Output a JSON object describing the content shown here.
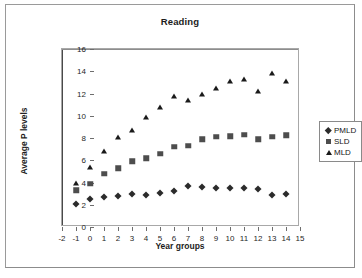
{
  "chart_data": {
    "type": "scatter",
    "title": "Reading",
    "xlabel": "Year groups",
    "ylabel": "Average P levels",
    "xlim": [
      -2,
      15
    ],
    "ylim": [
      0,
      16
    ],
    "xticks": [
      -2,
      -1,
      0,
      1,
      2,
      3,
      4,
      5,
      6,
      7,
      8,
      9,
      10,
      11,
      12,
      13,
      14,
      15
    ],
    "yticks": [
      0,
      2,
      4,
      6,
      8,
      10,
      12,
      14,
      16
    ],
    "grid": false,
    "legend_position": "right",
    "x": [
      -1,
      0,
      1,
      2,
      3,
      4,
      5,
      6,
      7,
      8,
      9,
      10,
      11,
      12,
      13,
      14
    ],
    "series": [
      {
        "name": "PMLD",
        "marker": "diamond",
        "color": "#2b2b2b",
        "values": [
          2.1,
          2.5,
          2.7,
          2.8,
          3.0,
          2.9,
          3.1,
          3.2,
          3.7,
          3.6,
          3.55,
          3.55,
          3.5,
          3.4,
          2.9,
          3.0
        ]
      },
      {
        "name": "SLD",
        "marker": "square",
        "color": "#4d4d4d",
        "values": [
          3.3,
          3.9,
          4.8,
          5.3,
          5.9,
          6.2,
          6.6,
          7.2,
          7.3,
          7.9,
          8.1,
          8.15,
          8.3,
          7.9,
          8.1,
          8.25
        ]
      },
      {
        "name": "MLD",
        "marker": "triangle",
        "color": "#1a1a1a",
        "values": [
          4.0,
          5.4,
          6.8,
          8.1,
          8.7,
          9.9,
          10.8,
          11.8,
          11.4,
          12.0,
          12.5,
          13.1,
          13.3,
          12.2,
          13.8,
          13.1
        ]
      }
    ]
  },
  "legend": {
    "entries": [
      {
        "label": "PMLD",
        "marker": "diamond"
      },
      {
        "label": "SLD",
        "marker": "square"
      },
      {
        "label": "MLD",
        "marker": "triangle"
      }
    ]
  }
}
